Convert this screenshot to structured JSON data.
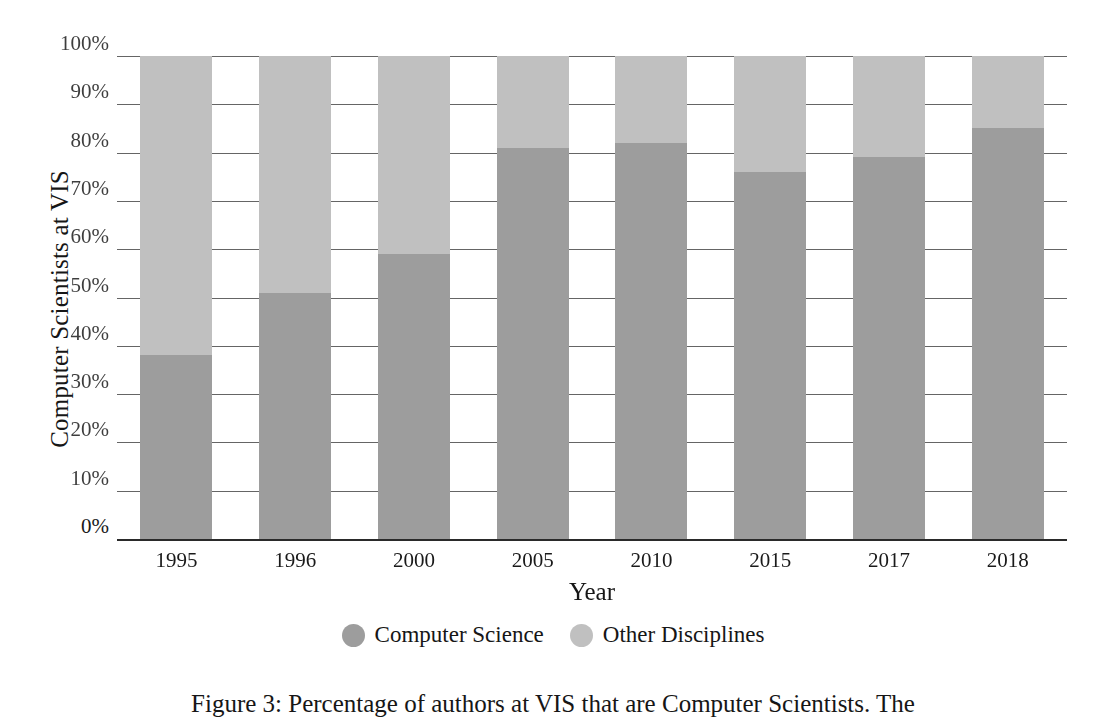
{
  "chart_data": {
    "type": "bar",
    "subtype": "stacked-percentage",
    "title": "",
    "xlabel": "Year",
    "ylabel": "Computer Scientists at VIS",
    "categories": [
      "1995",
      "1996",
      "2000",
      "2005",
      "2010",
      "2015",
      "2017",
      "2018"
    ],
    "series": [
      {
        "name": "Computer Science",
        "color": "#9d9d9d",
        "values": [
          38,
          51,
          59,
          81,
          82,
          76,
          79,
          85
        ]
      },
      {
        "name": "Other Disciplines",
        "color": "#c0c0c0",
        "values": [
          62,
          49,
          41,
          19,
          18,
          24,
          21,
          15
        ]
      }
    ],
    "ylim": [
      0,
      100
    ],
    "ytick_labels": [
      "100%",
      "90%",
      "80%",
      "70%",
      "60%",
      "50%",
      "40%",
      "30%",
      "20%",
      "10%",
      "0%"
    ],
    "ytick_values": [
      100,
      90,
      80,
      70,
      60,
      50,
      40,
      30,
      20,
      10,
      0
    ],
    "grid": true,
    "legend_position": "bottom-center",
    "legend_marker": "circle"
  },
  "axes": {
    "y_title": "Computer Scientists at VIS",
    "x_title": "Year"
  },
  "legend": {
    "items": [
      {
        "label": "Computer Science",
        "color": "#9d9d9d",
        "marker": "circle-swatch"
      },
      {
        "label": "Other Disciplines",
        "color": "#c0c0c0",
        "marker": "circle-swatch"
      }
    ]
  },
  "caption": {
    "text": "Figure 3: Percentage of authors at VIS that are Computer Scientists. The"
  }
}
